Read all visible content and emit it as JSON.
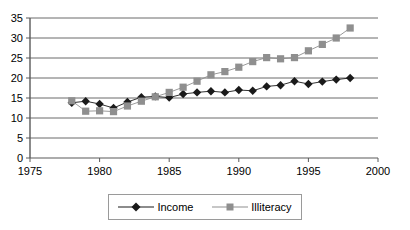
{
  "chart_data": {
    "type": "line",
    "title": "",
    "xlabel": "",
    "ylabel": "",
    "xlim": [
      1975,
      2000
    ],
    "ylim": [
      0,
      35
    ],
    "xticks": [
      1975,
      1980,
      1985,
      1990,
      1995,
      2000
    ],
    "yticks": [
      0,
      5,
      10,
      15,
      20,
      25,
      30,
      35
    ],
    "grid": "horizontal",
    "legend_position": "bottom",
    "x": [
      1978,
      1979,
      1980,
      1981,
      1982,
      1983,
      1984,
      1985,
      1986,
      1987,
      1988,
      1989,
      1990,
      1991,
      1992,
      1993,
      1994,
      1995,
      1996,
      1997,
      1998
    ],
    "series": [
      {
        "name": "Income",
        "marker": "diamond",
        "color": "#1a1a1a",
        "values": [
          13.8,
          14.2,
          13.5,
          12.5,
          14.0,
          15.2,
          15.4,
          15.1,
          16.0,
          16.4,
          16.7,
          16.4,
          17.0,
          16.8,
          17.9,
          18.2,
          19.2,
          18.5,
          19.1,
          19.6,
          20.0
        ]
      },
      {
        "name": "Illiteracy",
        "marker": "square",
        "color": "#8f8f8f",
        "values": [
          14.3,
          11.7,
          11.8,
          11.6,
          13.0,
          14.2,
          15.3,
          16.4,
          17.7,
          19.2,
          20.8,
          21.6,
          22.7,
          24.1,
          25.1,
          24.8,
          25.1,
          26.8,
          28.4,
          30.0,
          32.5
        ]
      }
    ]
  },
  "legend": {
    "entries": [
      {
        "label": "Income",
        "marker": "diamond-marker-icon"
      },
      {
        "label": "Illiteracy",
        "marker": "square-marker-icon"
      }
    ]
  },
  "colors": {
    "income": "#1a1a1a",
    "illiteracy": "#8f8f8f",
    "gridline": "#5a5a5a",
    "axis": "#5a5a5a",
    "background": "#ffffff"
  }
}
